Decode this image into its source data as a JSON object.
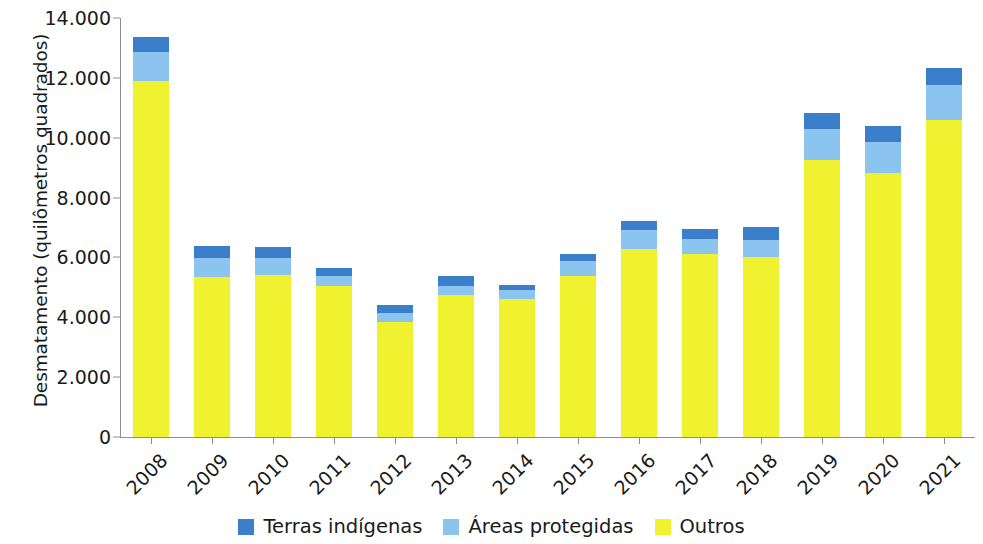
{
  "chart_data": {
    "type": "bar",
    "subtype": "stacked-bar",
    "title": "",
    "xlabel": "",
    "ylabel": "Desmatamento (quilômetros quadrados)",
    "ylim": [
      0,
      14000
    ],
    "ytick_labels": [
      "14.000",
      "12.000",
      "10.000",
      "8.000",
      "6.000",
      "4.000",
      "2.000",
      "0"
    ],
    "ytick_values": [
      14000,
      12000,
      10000,
      8000,
      6000,
      4000,
      2000,
      0
    ],
    "grid": false,
    "legend_position": "bottom",
    "categories": [
      "2008",
      "2009",
      "2010",
      "2011",
      "2012",
      "2013",
      "2014",
      "2015",
      "2016",
      "2017",
      "2018",
      "2019",
      "2020",
      "2021"
    ],
    "series": [
      {
        "name": "Outros",
        "color": "#f0f22f",
        "values": [
          11900,
          5350,
          5420,
          5060,
          3840,
          4750,
          4610,
          5380,
          6280,
          6120,
          6030,
          9250,
          8830,
          10590
        ]
      },
      {
        "name": "Áreas protegidas",
        "color": "#8cc4f0",
        "values": [
          970,
          630,
          570,
          330,
          300,
          300,
          300,
          510,
          630,
          480,
          540,
          1050,
          1020,
          1170
        ]
      },
      {
        "name": "Terras indígenas",
        "color": "#3b7fca",
        "values": [
          510,
          400,
          360,
          260,
          270,
          330,
          170,
          210,
          320,
          350,
          440,
          540,
          540,
          570
        ]
      }
    ],
    "totals": [
      13380,
      6380,
      6350,
      5650,
      4410,
      5380,
      5080,
      6100,
      7230,
      6950,
      7010,
      10840,
      10390,
      12330
    ]
  },
  "legend": {
    "items": [
      {
        "label": "Terras indígenas",
        "color": "#3b7fca"
      },
      {
        "label": "Áreas protegidas",
        "color": "#8cc4f0"
      },
      {
        "label": "Outros",
        "color": "#f0f22f"
      }
    ]
  }
}
